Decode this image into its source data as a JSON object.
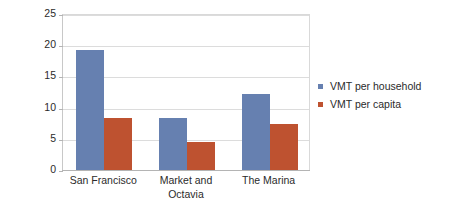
{
  "chart_data": {
    "type": "bar",
    "title": "",
    "subtitle": "",
    "xlabel": "",
    "ylabel": "Average daily VMT",
    "ylim": [
      0,
      25
    ],
    "yticks": [
      0,
      5,
      10,
      15,
      20,
      25
    ],
    "ytick_labels": [
      "0",
      "5",
      "10",
      "15",
      "20",
      "25"
    ],
    "grid": "horizontal",
    "legend_position": "right",
    "categories": [
      "San Francisco",
      "Market and Octavia",
      "The Marina"
    ],
    "category_lines": [
      [
        "San Francisco"
      ],
      [
        "Market and",
        "Octavia"
      ],
      [
        "The Marina"
      ]
    ],
    "series": [
      {
        "name": "VMT per household",
        "color": "#6680b0",
        "values": [
          19.2,
          8.4,
          12.2
        ]
      },
      {
        "name": "VMT per capita",
        "color": "#be5230",
        "values": [
          8.3,
          4.5,
          7.4
        ]
      }
    ],
    "colors": {
      "series_0": "#6680b0",
      "series_1": "#be5230",
      "gridline": "#dcdcdc",
      "axis": "#b4b4b4",
      "text": "#2b2b2b",
      "background": "#ffffff"
    }
  }
}
